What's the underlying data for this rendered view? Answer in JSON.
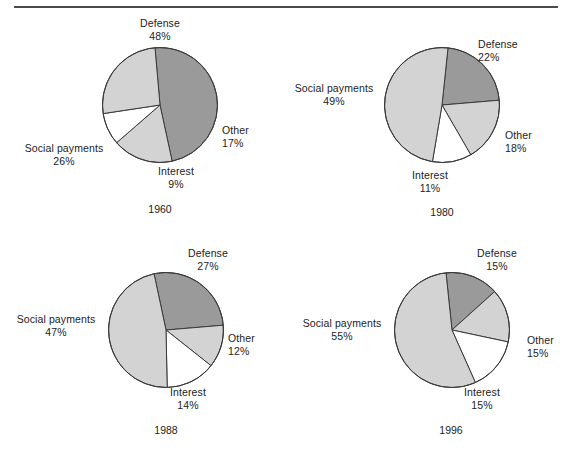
{
  "figure": {
    "rule_color": "#4a4a4a",
    "background": "#ffffff"
  },
  "colors": {
    "defense": "#9a9a9a",
    "other": "#d3d3d3",
    "interest": "#ffffff",
    "social_payments": "#d3d3d3",
    "outline": "#3a3a3a",
    "text": "#1c1c1c"
  },
  "chart_data": [
    {
      "type": "pie",
      "title": "1960",
      "labels": [
        "Defense",
        "Other",
        "Interest",
        "Social payments"
      ],
      "values": [
        48,
        17,
        9,
        26
      ],
      "value_labels": [
        "48%",
        "17%",
        "9%",
        "26%"
      ],
      "colors": [
        "#9a9a9a",
        "#d3d3d3",
        "#ffffff",
        "#d3d3d3"
      ],
      "start_angle_deg": -5,
      "direction": "clockwise",
      "units": "percent",
      "legend": "none",
      "labels_position": "outside callout text"
    },
    {
      "type": "pie",
      "title": "1980",
      "labels": [
        "Defense",
        "Other",
        "Interest",
        "Social payments"
      ],
      "values": [
        22,
        18,
        11,
        49
      ],
      "value_labels": [
        "22%",
        "18%",
        "11%",
        "49%"
      ],
      "colors": [
        "#9a9a9a",
        "#d3d3d3",
        "#ffffff",
        "#d3d3d3"
      ],
      "start_angle_deg": 6,
      "direction": "clockwise",
      "units": "percent",
      "legend": "none",
      "labels_position": "outside callout text"
    },
    {
      "type": "pie",
      "title": "1988",
      "labels": [
        "Defense",
        "Other",
        "Interest",
        "Social payments"
      ],
      "values": [
        27,
        12,
        14,
        47
      ],
      "value_labels": [
        "27%",
        "12%",
        "14%",
        "47%"
      ],
      "colors": [
        "#9a9a9a",
        "#d3d3d3",
        "#ffffff",
        "#d3d3d3"
      ],
      "start_angle_deg": -12,
      "direction": "clockwise",
      "units": "percent",
      "legend": "none",
      "labels_position": "outside callout text"
    },
    {
      "type": "pie",
      "title": "1996",
      "labels": [
        "Defense",
        "Other",
        "Interest",
        "Social payments"
      ],
      "values": [
        15,
        15,
        15,
        55
      ],
      "value_labels": [
        "15%",
        "15%",
        "15%",
        "55%"
      ],
      "colors": [
        "#9a9a9a",
        "#d3d3d3",
        "#ffffff",
        "#d3d3d3"
      ],
      "start_angle_deg": -6,
      "direction": "clockwise",
      "units": "percent",
      "legend": "none",
      "labels_position": "outside callout text"
    }
  ],
  "panels": [
    {
      "id": "p1960",
      "year": "1960",
      "labels": {
        "defense_name": "Defense",
        "defense_pct": "48%",
        "other_name": "Other",
        "other_pct": "17%",
        "interest_name": "Interest",
        "interest_pct": "9%",
        "social_name": "Social payments",
        "social_pct": "26%"
      }
    },
    {
      "id": "p1980",
      "year": "1980",
      "labels": {
        "defense_name": "Defense",
        "defense_pct": "22%",
        "other_name": "Other",
        "other_pct": "18%",
        "interest_name": "Interest",
        "interest_pct": "11%",
        "social_name": "Social payments",
        "social_pct": "49%"
      }
    },
    {
      "id": "p1988",
      "year": "1988",
      "labels": {
        "defense_name": "Defense",
        "defense_pct": "27%",
        "other_name": "Other",
        "other_pct": "12%",
        "interest_name": "Interest",
        "interest_pct": "14%",
        "social_name": "Social payments",
        "social_pct": "47%"
      }
    },
    {
      "id": "p1996",
      "year": "1996",
      "labels": {
        "defense_name": "Defense",
        "defense_pct": "15%",
        "other_name": "Other",
        "other_pct": "15%",
        "interest_name": "Interest",
        "interest_pct": "15%",
        "social_name": "Social payments",
        "social_pct": "55%"
      }
    }
  ]
}
